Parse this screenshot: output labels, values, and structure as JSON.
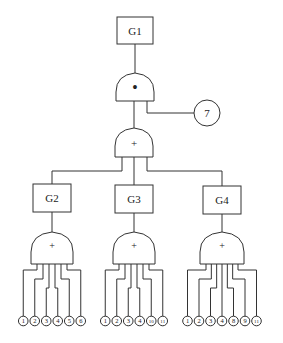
{
  "diagram": {
    "type": "fault-tree",
    "top_event": {
      "id": "G1",
      "label": "G1"
    },
    "top_gate": {
      "type": "AND",
      "symbol": "•",
      "inputs": [
        "OR-main",
        "7"
      ]
    },
    "side_event": {
      "id": "7",
      "label": "7"
    },
    "main_gate": {
      "type": "OR",
      "symbol": "+",
      "inputs": [
        "G2",
        "G3",
        "G4"
      ]
    },
    "subsystems": [
      {
        "id": "G2",
        "label": "G2",
        "gate": {
          "type": "OR",
          "symbol": "+"
        },
        "events": [
          "1",
          "2",
          "3",
          "4",
          "5",
          "6"
        ]
      },
      {
        "id": "G3",
        "label": "G3",
        "gate": {
          "type": "OR",
          "symbol": "+"
        },
        "events": [
          "1",
          "2",
          "3",
          "4",
          "10",
          "11"
        ]
      },
      {
        "id": "G4",
        "label": "G4",
        "gate": {
          "type": "OR",
          "symbol": "+"
        },
        "events": [
          "1",
          "2",
          "3",
          "4",
          "8",
          "9",
          "11"
        ]
      }
    ]
  }
}
